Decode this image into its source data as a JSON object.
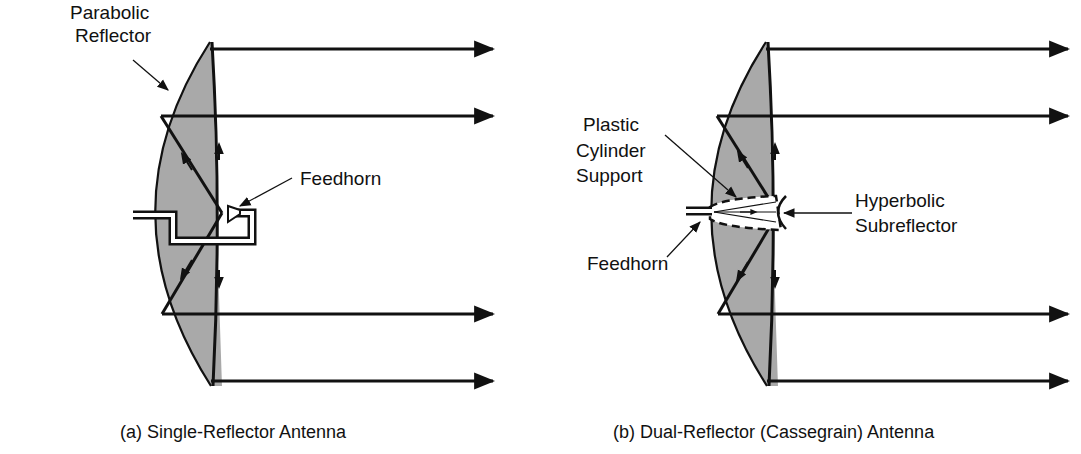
{
  "figure": {
    "panel_a": {
      "caption": "(a) Single-Reflector Antenna",
      "labels": {
        "reflector_line1": "Parabolic",
        "reflector_line2": "Reflector",
        "feedhorn": "Feedhorn"
      }
    },
    "panel_b": {
      "caption": "(b) Dual-Reflector (Cassegrain) Antenna",
      "labels": {
        "support_line1": "Plastic",
        "support_line2": "Cylinder",
        "support_line3": "Support",
        "subreflector_line1": "Hyperbolic",
        "subreflector_line2": "Subreflector",
        "feedhorn": "Feedhorn"
      }
    },
    "colors": {
      "reflector_fill": "#a9a9a9",
      "stroke": "#111111",
      "background": "#ffffff"
    }
  }
}
